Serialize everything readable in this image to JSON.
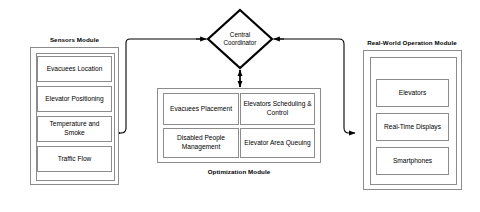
{
  "diagram": {
    "colors": {
      "stroke": "#8c8c8c",
      "arrow": "#000000",
      "background": "#ffffff",
      "text": "#000000"
    }
  },
  "central": {
    "label_line1": "Central",
    "label_line2": "Coordinator",
    "shape": "diamond"
  },
  "sensors_module": {
    "title": "Sensors Module",
    "items": [
      {
        "label": "Evacuees Location"
      },
      {
        "label": "Elevator Positioning"
      },
      {
        "label": "Temperature and Smoke"
      },
      {
        "label": "Traffic Flow"
      }
    ]
  },
  "optimization_module": {
    "title": "Optimization Module",
    "items": [
      {
        "label": "Evacuees Placement"
      },
      {
        "label": "Elevators Scheduling & Control"
      },
      {
        "label": "Disabled People Management"
      },
      {
        "label": "Elevator Area Queuing"
      }
    ]
  },
  "real_world_module": {
    "title": "Real-World Operation Module",
    "items": [
      {
        "label": "Elevators"
      },
      {
        "label": "Real-Time Displays"
      },
      {
        "label": "Smartphones"
      }
    ]
  },
  "connectors": [
    {
      "name": "sensors-to-coordinator",
      "from": "Sensors Module",
      "to": "Central Coordinator",
      "direction": "to-sensors",
      "style": "elbow"
    },
    {
      "name": "coordinator-to-real-world",
      "from": "Central Coordinator",
      "to": "Real-World Operation Module",
      "direction": "to-real-world",
      "style": "elbow"
    },
    {
      "name": "coordinator-optimization",
      "from": "Central Coordinator",
      "to": "Optimization Module",
      "direction": "bidirectional",
      "style": "straight"
    }
  ]
}
